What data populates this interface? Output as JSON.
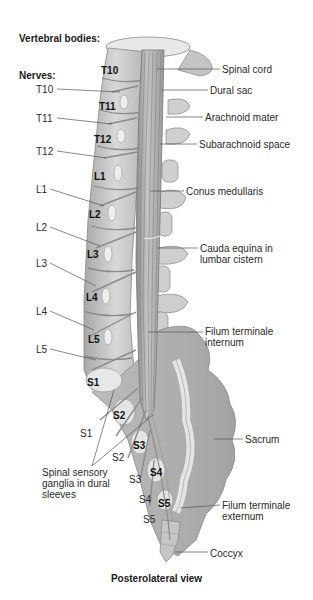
{
  "headers": {
    "vertebral_bodies": "Vertebral bodies:",
    "nerves": "Nerves:"
  },
  "vertebral_body_labels": [
    {
      "id": "T10",
      "text": "T10",
      "x": 101,
      "y": 65
    },
    {
      "id": "T11",
      "text": "T11",
      "x": 99,
      "y": 101
    },
    {
      "id": "T12",
      "text": "T12",
      "x": 94,
      "y": 134
    },
    {
      "id": "L1",
      "text": "L1",
      "x": 94,
      "y": 171
    },
    {
      "id": "L2",
      "text": "L2",
      "x": 89,
      "y": 209
    },
    {
      "id": "L3",
      "text": "L3",
      "x": 87,
      "y": 249
    },
    {
      "id": "L4",
      "text": "L4",
      "x": 86,
      "y": 292
    },
    {
      "id": "L5",
      "text": "L5",
      "x": 88,
      "y": 334
    },
    {
      "id": "S1",
      "text": "S1",
      "x": 87,
      "y": 377
    },
    {
      "id": "S2",
      "text": "S2",
      "x": 113,
      "y": 410
    },
    {
      "id": "S3",
      "text": "S3",
      "x": 133,
      "y": 440
    },
    {
      "id": "S4",
      "text": "S4",
      "x": 150,
      "y": 467
    },
    {
      "id": "S5",
      "text": "S5",
      "x": 158,
      "y": 498
    }
  ],
  "nerve_labels": [
    {
      "id": "T10",
      "text": "T10",
      "x": 36,
      "y": 84
    },
    {
      "id": "T11",
      "text": "T11",
      "x": 36,
      "y": 113
    },
    {
      "id": "T12",
      "text": "T12",
      "x": 36,
      "y": 146
    },
    {
      "id": "L1",
      "text": "L1",
      "x": 36,
      "y": 184
    },
    {
      "id": "L2",
      "text": "L2",
      "x": 36,
      "y": 222
    },
    {
      "id": "L3",
      "text": "L3",
      "x": 36,
      "y": 258
    },
    {
      "id": "L4",
      "text": "L4",
      "x": 36,
      "y": 306
    },
    {
      "id": "L5",
      "text": "L5",
      "x": 36,
      "y": 344
    },
    {
      "id": "S1",
      "text": "S1",
      "x": 80,
      "y": 428
    },
    {
      "id": "S2",
      "text": "S2",
      "x": 112,
      "y": 452
    },
    {
      "id": "S3",
      "text": "S3",
      "x": 129,
      "y": 474
    },
    {
      "id": "S4",
      "text": "S4",
      "x": 139,
      "y": 494
    },
    {
      "id": "S5",
      "text": "S5",
      "x": 143,
      "y": 514
    }
  ],
  "structure_labels": [
    {
      "id": "spinal-cord",
      "text": "Spinal cord",
      "x": 222,
      "y": 64
    },
    {
      "id": "dural-sac",
      "text": "Dural sac",
      "x": 210,
      "y": 85
    },
    {
      "id": "arachnoid-mater",
      "text": "Arachnoid mater",
      "x": 205,
      "y": 112
    },
    {
      "id": "subarachnoid-space",
      "text": "Subarachnoid space",
      "x": 199,
      "y": 139
    },
    {
      "id": "conus-medullaris",
      "text": "Conus medullaris",
      "x": 186,
      "y": 186
    },
    {
      "id": "cauda-equina",
      "text": "Cauda equina in lumbar cistern",
      "x": 200,
      "y": 243,
      "w": 92
    },
    {
      "id": "filum-terminale-internum",
      "text": "Filum terminale internum",
      "x": 205,
      "y": 326,
      "w": 90
    },
    {
      "id": "sacrum",
      "text": "Sacrum",
      "x": 245,
      "y": 434
    },
    {
      "id": "spinal-sensory-ganglia",
      "text": "Spinal sensory ganglia in dural sleeves",
      "x": 42,
      "y": 467,
      "w": 92
    },
    {
      "id": "filum-terminale-externum",
      "text": "Filum terminale externum",
      "x": 222,
      "y": 500,
      "w": 80
    },
    {
      "id": "coccyx",
      "text": "Coccyx",
      "x": 210,
      "y": 548
    }
  ],
  "caption": "Posterolateral view",
  "colors": {
    "bone_fill": "#c9c9c9",
    "bone_light": "#e6e6e6",
    "bone_dark": "#8f8f8f",
    "nerve": "#9a9a9a",
    "leader_line": "#555555",
    "text": "#2a2a2a"
  }
}
